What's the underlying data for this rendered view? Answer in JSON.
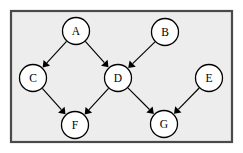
{
  "figure": {
    "background_color": "#ffffff",
    "panel_color": "#ededed",
    "border_color": "#4a4a4a",
    "node_fill": "#ffffff",
    "node_stroke": "#000000",
    "edge_color": "#000000"
  },
  "frame": {
    "x": 11,
    "y": 11,
    "width": 221,
    "height": 131
  },
  "chart_data": {
    "type": "diagram",
    "title": "",
    "node_radius": 13.5,
    "nodes": [
      {
        "id": "A",
        "label": "A",
        "x": 76,
        "y": 31
      },
      {
        "id": "B",
        "label": "B",
        "x": 165,
        "y": 32
      },
      {
        "id": "C",
        "label": "C",
        "x": 33,
        "y": 78
      },
      {
        "id": "D",
        "label": "D",
        "x": 118,
        "y": 78
      },
      {
        "id": "E",
        "label": "E",
        "x": 209,
        "y": 78
      },
      {
        "id": "F",
        "label": "F",
        "x": 75,
        "y": 125
      },
      {
        "id": "G",
        "label": "G",
        "x": 164,
        "y": 124
      }
    ],
    "edges": [
      {
        "from": "A",
        "to": "C",
        "directed": true
      },
      {
        "from": "A",
        "to": "D",
        "directed": true
      },
      {
        "from": "B",
        "to": "D",
        "directed": true
      },
      {
        "from": "C",
        "to": "F",
        "directed": true
      },
      {
        "from": "D",
        "to": "F",
        "directed": true
      },
      {
        "from": "D",
        "to": "G",
        "directed": true
      },
      {
        "from": "E",
        "to": "G",
        "directed": true
      }
    ]
  }
}
